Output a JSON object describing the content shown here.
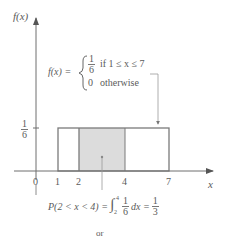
{
  "diagram": {
    "y_axis_label": "f(x)",
    "x_axis_label": "x",
    "x_ticks": [
      "0",
      "1",
      "2",
      "4",
      "7"
    ],
    "y_tick": {
      "numerator": "1",
      "denominator": "6"
    },
    "pdf_definition": {
      "lhs": "f(x) =",
      "case1_value_num": "1",
      "case1_value_den": "6",
      "case1_condition": "if 1 ≤ x ≤ 7",
      "case2_value": "0",
      "case2_condition": "otherwise"
    },
    "probability": {
      "lhs": "P(2 < x < 4) =",
      "integral_upper": "4",
      "integral_lower": "2",
      "integrand_num": "1",
      "integrand_den": "6",
      "dx": "dx =",
      "result_num": "1",
      "result_den": "3"
    },
    "footer_text": "or",
    "colors": {
      "axis": "#6e6e6e",
      "rect_stroke": "#7a7a7a",
      "shade": "#dcdcdc",
      "text": "#5a5a5a"
    }
  }
}
